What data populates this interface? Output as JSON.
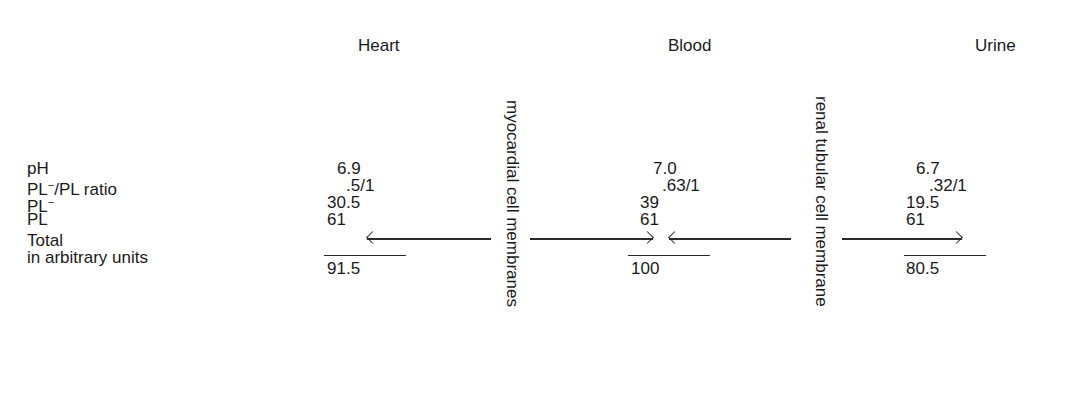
{
  "columns": {
    "heart": "Heart",
    "blood": "Blood",
    "urine": "Urine"
  },
  "membranes": {
    "myocardial": "myocardial cell membranes",
    "renal": "renal tubular cell membrane"
  },
  "rows": {
    "ph": "pH",
    "ratio_pl": "PL",
    "ratio_sup": "−",
    "ratio_rest": "/PL ratio",
    "plminus": "PL",
    "plminus_sup": "−",
    "pl": "PL",
    "total": "Total",
    "units": "in arbitrary units"
  },
  "values": {
    "heart": {
      "ph": "6.9",
      "ratio": ".5/1",
      "pl_minus": "30.5",
      "pl": "61",
      "total": "91.5"
    },
    "blood": {
      "ph": "7.0",
      "ratio": ".63/1",
      "pl_minus": "39",
      "pl": "61",
      "total": "100"
    },
    "urine": {
      "ph": "6.7",
      "ratio": ".32/1",
      "pl_minus": "19.5",
      "pl": "61",
      "total": "80.5"
    }
  },
  "arrows": [
    {
      "from": "myocardial cell membranes",
      "to": "Heart PL",
      "direction": "left"
    },
    {
      "from": "myocardial cell membranes",
      "to": "Blood PL",
      "direction": "right"
    },
    {
      "from": "renal tubular cell membrane",
      "to": "Blood PL",
      "direction": "left"
    },
    {
      "from": "renal tubular cell membrane",
      "to": "Urine PL",
      "direction": "right"
    }
  ]
}
